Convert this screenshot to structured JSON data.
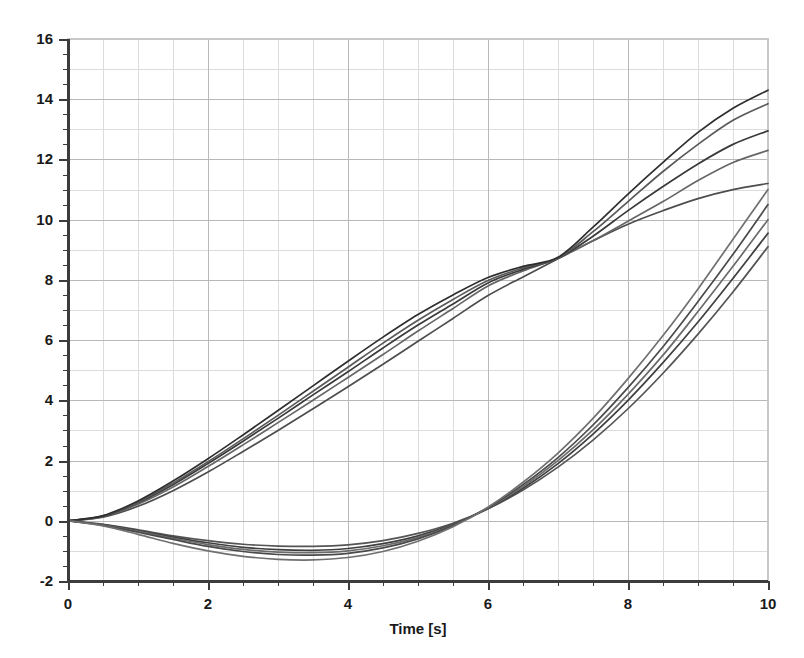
{
  "chart_data": {
    "type": "line",
    "title": "",
    "subtitle": "",
    "xlabel": "Time [s]",
    "ylabel": "",
    "xlim": [
      0,
      10
    ],
    "ylim": [
      -2,
      16
    ],
    "x_ticks": [
      0,
      2,
      4,
      6,
      8,
      10
    ],
    "x_tick_labels": [
      "0",
      "2",
      "4",
      "6",
      "8",
      "10"
    ],
    "x_minor_step": 0.5,
    "y_ticks": [
      -2,
      0,
      2,
      4,
      6,
      8,
      10,
      12,
      14,
      16
    ],
    "y_tick_labels": [
      "-2",
      "0",
      "2",
      "4",
      "6",
      "8",
      "10",
      "12",
      "14",
      "16"
    ],
    "y_minor_step": 0.5,
    "grid": true,
    "grid_major_color": "#b8b8b8",
    "grid_minor_color": "#dcdcdc",
    "legend": "none",
    "background": "#ffffff",
    "axis_color": "#3c3c3c",
    "x": [
      0,
      0.5,
      1,
      1.5,
      2,
      2.5,
      3,
      3.5,
      4,
      4.5,
      5,
      5.5,
      6,
      6.5,
      7,
      7.5,
      8,
      8.5,
      9,
      9.5,
      10
    ],
    "series": [
      {
        "name": "rising-1",
        "color": "#4d4d4d",
        "values": [
          0,
          0.12,
          0.48,
          1.0,
          1.62,
          2.3,
          3.0,
          3.72,
          4.45,
          5.2,
          5.96,
          6.72,
          7.48,
          8.1,
          8.7,
          9.3,
          9.85,
          10.3,
          10.7,
          11.0,
          11.2
        ]
      },
      {
        "name": "rising-2",
        "color": "#666666",
        "values": [
          0,
          0.14,
          0.55,
          1.12,
          1.8,
          2.52,
          3.26,
          4.0,
          4.76,
          5.52,
          6.3,
          7.05,
          7.8,
          8.3,
          8.72,
          9.3,
          9.95,
          10.6,
          11.3,
          11.9,
          12.3
        ]
      },
      {
        "name": "rising-3",
        "color": "#3a3a3a",
        "values": [
          0,
          0.15,
          0.6,
          1.2,
          1.9,
          2.64,
          3.4,
          4.18,
          4.95,
          5.74,
          6.5,
          7.2,
          7.9,
          8.35,
          8.72,
          9.45,
          10.3,
          11.1,
          11.85,
          12.5,
          12.95
        ]
      },
      {
        "name": "rising-4",
        "color": "#595959",
        "values": [
          0,
          0.16,
          0.62,
          1.25,
          1.96,
          2.72,
          3.5,
          4.3,
          5.1,
          5.9,
          6.66,
          7.35,
          7.98,
          8.4,
          8.72,
          9.6,
          10.6,
          11.6,
          12.5,
          13.3,
          13.85
        ]
      },
      {
        "name": "rising-5",
        "color": "#2e2e2e",
        "values": [
          0,
          0.17,
          0.66,
          1.32,
          2.06,
          2.85,
          3.66,
          4.48,
          5.3,
          6.1,
          6.85,
          7.5,
          8.08,
          8.45,
          8.75,
          9.75,
          10.85,
          11.9,
          12.9,
          13.7,
          14.3
        ]
      },
      {
        "name": "dipping-1",
        "color": "#555555",
        "values": [
          0,
          -0.12,
          -0.3,
          -0.5,
          -0.66,
          -0.78,
          -0.84,
          -0.85,
          -0.8,
          -0.66,
          -0.42,
          -0.08,
          0.4,
          1.02,
          1.78,
          2.68,
          3.72,
          4.9,
          6.2,
          7.6,
          9.1
        ]
      },
      {
        "name": "dipping-2",
        "color": "#3f3f3f",
        "values": [
          0,
          -0.13,
          -0.33,
          -0.54,
          -0.73,
          -0.88,
          -0.96,
          -0.98,
          -0.92,
          -0.76,
          -0.5,
          -0.12,
          0.4,
          1.08,
          1.9,
          2.88,
          4.0,
          5.25,
          6.6,
          8.05,
          9.55
        ]
      },
      {
        "name": "dipping-3",
        "color": "#6b6b6b",
        "values": [
          0,
          -0.14,
          -0.35,
          -0.58,
          -0.79,
          -0.95,
          -1.04,
          -1.06,
          -1.0,
          -0.83,
          -0.55,
          -0.14,
          0.42,
          1.14,
          2.0,
          3.02,
          4.2,
          5.5,
          6.95,
          8.45,
          10.0
        ]
      },
      {
        "name": "dipping-4",
        "color": "#4a4a4a",
        "values": [
          0,
          -0.15,
          -0.38,
          -0.62,
          -0.85,
          -1.02,
          -1.12,
          -1.14,
          -1.08,
          -0.9,
          -0.6,
          -0.16,
          0.44,
          1.2,
          2.1,
          3.18,
          4.42,
          5.78,
          7.28,
          8.85,
          10.5
        ]
      },
      {
        "name": "dipping-5",
        "color": "#707070",
        "values": [
          0,
          -0.17,
          -0.45,
          -0.75,
          -1.0,
          -1.18,
          -1.28,
          -1.3,
          -1.22,
          -1.02,
          -0.68,
          -0.2,
          0.45,
          1.28,
          2.25,
          3.4,
          4.72,
          6.15,
          7.7,
          9.35,
          11.0
        ]
      }
    ]
  },
  "axes": {
    "x_axis_title": "Time [s]"
  }
}
